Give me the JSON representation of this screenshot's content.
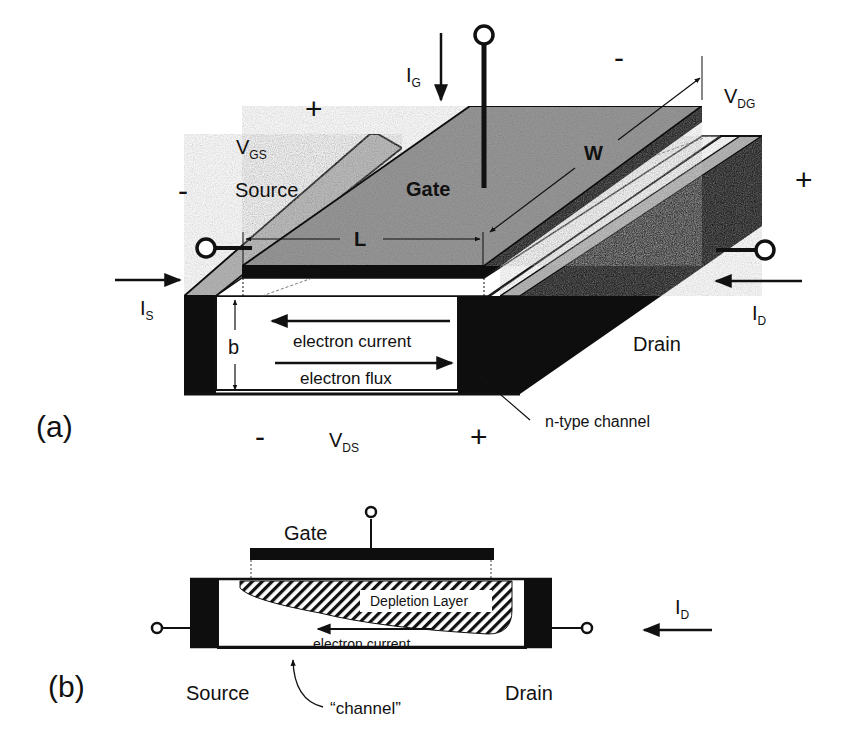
{
  "figure": {
    "colors": {
      "background": "#ffffff",
      "ink": "#111111",
      "gate_surface": "#9a9a9a",
      "side_surface": "#b8b8b8",
      "contact_fill": "#0e0e0e"
    }
  },
  "panel_a": {
    "label": "(a)",
    "gate_label": "Gate",
    "source_label": "Source",
    "drain_label": "Drain",
    "channel_label": "n-type channel",
    "dim_L": "L",
    "dim_W": "W",
    "dim_b": "b",
    "electron_current": "electron current",
    "electron_flux": "electron flux",
    "currents": {
      "IG": {
        "main": "I",
        "sub": "G"
      },
      "IS": {
        "main": "I",
        "sub": "S"
      },
      "ID": {
        "main": "I",
        "sub": "D"
      }
    },
    "voltages": {
      "VGS": {
        "main": "V",
        "sub": "GS",
        "plus": "+",
        "minus": "-"
      },
      "VDG": {
        "main": "V",
        "sub": "DG",
        "plus": "+",
        "minus": "-"
      },
      "VDS": {
        "main": "V",
        "sub": "DS",
        "plus": "+",
        "minus": "-"
      }
    }
  },
  "panel_b": {
    "label": "(b)",
    "gate_label": "Gate",
    "depletion_label": "Depletion Layer",
    "electron_current": "electron current",
    "source_label": "Source",
    "drain_label": "Drain",
    "channel_label": "“channel”",
    "current": {
      "main": "I",
      "sub": "D"
    }
  }
}
